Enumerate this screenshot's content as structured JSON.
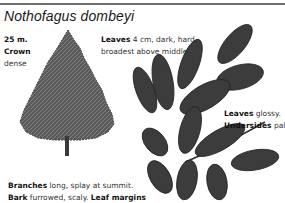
{
  "page": {
    "species_title": "Nothofagus dombeyi"
  },
  "annotations": {
    "height": {
      "bold": "25 m.",
      "text": ""
    },
    "crown": {
      "bold": "Crown",
      "text": "dense"
    },
    "leaves_top": {
      "bold": "Leaves",
      "text": " 4 cm, dark, hard,",
      "line2": "broadest above middle"
    },
    "leaves_right": {
      "bold": "Leaves",
      "text": " glossy."
    },
    "undersides": {
      "bold": "Undersides",
      "text": " paler"
    },
    "branches": {
      "bold": "Branches",
      "text": " long, splay at summit."
    },
    "bark": {
      "bold": "Bark",
      "text": " furrowed, scaly. ",
      "bold2": "Leaf margins"
    }
  },
  "illustrations": {
    "tree": "tree-silhouette-illustration",
    "leaf_spray": "leaf-spray-illustration"
  },
  "colors": {
    "rule": "#6e6e6e",
    "foliage": "#4a4a4a",
    "leaf": "#3a3a3a",
    "vein": "#bdbdbd"
  }
}
